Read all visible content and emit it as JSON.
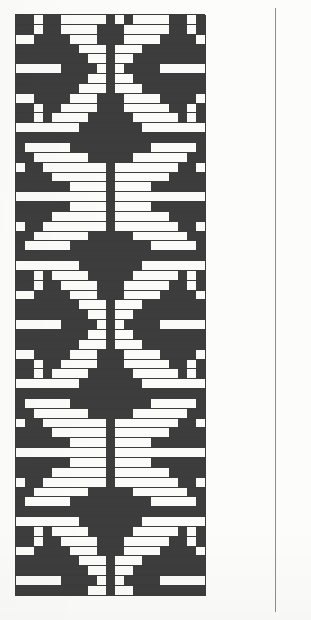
{
  "document": {
    "type": "knitting-chart",
    "corner_mark": "",
    "background_color": "#fcfcfb",
    "rule_color": "#8e8e8e"
  },
  "chart_data": {
    "type": "heatmap",
    "title": "",
    "subtitle": "",
    "xlabel": "",
    "ylabel": "",
    "columns": 21,
    "rows": 59,
    "legend": [
      {
        "key": 1,
        "label": "dark stitch",
        "color": "#3d3d3d"
      },
      {
        "key": 0,
        "label": "light stitch",
        "color": "#fbfbfa"
      }
    ],
    "grid": true,
    "grid_line_color": "#3b3b3b",
    "cell_width_px": 10,
    "cell_height_px": 9.85,
    "origin_px": {
      "x": 15,
      "y": 14
    },
    "values": [
      [
        1,
        1,
        0,
        1,
        1,
        0,
        0,
        0,
        0,
        0,
        1,
        0,
        1,
        0,
        0,
        0,
        0,
        1,
        1,
        0,
        1
      ],
      [
        1,
        1,
        0,
        1,
        1,
        0,
        0,
        0,
        0,
        1,
        1,
        1,
        0,
        0,
        0,
        0,
        0,
        1,
        1,
        0,
        1
      ],
      [
        0,
        0,
        1,
        1,
        1,
        1,
        0,
        0,
        0,
        1,
        1,
        1,
        0,
        0,
        0,
        0,
        1,
        1,
        1,
        1,
        0
      ],
      [
        1,
        1,
        1,
        1,
        1,
        1,
        1,
        0,
        0,
        0,
        1,
        0,
        0,
        0,
        1,
        1,
        1,
        1,
        1,
        1,
        1
      ],
      [
        1,
        1,
        1,
        1,
        1,
        1,
        1,
        1,
        0,
        0,
        1,
        0,
        0,
        1,
        1,
        1,
        1,
        1,
        1,
        1,
        1
      ],
      [
        0,
        0,
        0,
        0,
        0,
        1,
        1,
        1,
        1,
        0,
        1,
        0,
        1,
        1,
        1,
        1,
        0,
        0,
        0,
        0,
        0
      ],
      [
        1,
        1,
        1,
        1,
        1,
        1,
        1,
        1,
        0,
        0,
        1,
        0,
        0,
        1,
        1,
        1,
        1,
        1,
        1,
        1,
        1
      ],
      [
        1,
        1,
        1,
        1,
        1,
        1,
        1,
        0,
        0,
        0,
        1,
        0,
        0,
        0,
        1,
        1,
        1,
        1,
        1,
        1,
        1
      ],
      [
        0,
        0,
        1,
        1,
        1,
        1,
        0,
        0,
        0,
        1,
        1,
        1,
        0,
        0,
        0,
        0,
        1,
        1,
        1,
        1,
        0
      ],
      [
        1,
        1,
        0,
        1,
        1,
        0,
        0,
        0,
        0,
        1,
        1,
        1,
        0,
        0,
        0,
        0,
        0,
        1,
        1,
        0,
        1
      ],
      [
        1,
        1,
        0,
        1,
        0,
        0,
        0,
        0,
        1,
        1,
        1,
        1,
        1,
        0,
        0,
        0,
        0,
        0,
        1,
        0,
        1
      ],
      [
        0,
        0,
        0,
        0,
        0,
        0,
        0,
        1,
        1,
        1,
        1,
        1,
        1,
        1,
        0,
        0,
        0,
        0,
        0,
        0,
        0
      ],
      [
        1,
        1,
        1,
        1,
        1,
        1,
        1,
        1,
        1,
        1,
        1,
        1,
        1,
        1,
        1,
        1,
        1,
        1,
        1,
        1,
        1
      ],
      [
        1,
        0,
        0,
        0,
        0,
        0,
        1,
        1,
        1,
        1,
        1,
        1,
        1,
        1,
        1,
        0,
        0,
        0,
        0,
        0,
        1
      ],
      [
        1,
        1,
        0,
        0,
        0,
        0,
        0,
        0,
        1,
        1,
        1,
        1,
        1,
        0,
        0,
        0,
        0,
        0,
        0,
        1,
        1
      ],
      [
        0,
        1,
        1,
        0,
        0,
        0,
        0,
        0,
        0,
        0,
        1,
        0,
        0,
        0,
        0,
        0,
        0,
        0,
        1,
        1,
        0
      ],
      [
        1,
        1,
        1,
        1,
        0,
        0,
        0,
        0,
        0,
        0,
        1,
        0,
        0,
        0,
        0,
        0,
        0,
        1,
        1,
        1,
        1
      ],
      [
        1,
        1,
        1,
        1,
        1,
        1,
        0,
        0,
        0,
        0,
        1,
        0,
        0,
        0,
        0,
        1,
        1,
        1,
        1,
        1,
        1
      ],
      [
        0,
        0,
        0,
        0,
        0,
        0,
        0,
        0,
        0,
        0,
        1,
        0,
        0,
        0,
        0,
        0,
        0,
        0,
        0,
        0,
        0
      ],
      [
        1,
        1,
        1,
        1,
        1,
        1,
        0,
        0,
        0,
        0,
        1,
        0,
        0,
        0,
        0,
        1,
        1,
        1,
        1,
        1,
        1
      ],
      [
        1,
        1,
        1,
        1,
        0,
        0,
        0,
        0,
        0,
        0,
        1,
        0,
        0,
        0,
        0,
        0,
        0,
        1,
        1,
        1,
        1
      ],
      [
        0,
        1,
        1,
        0,
        0,
        0,
        0,
        0,
        0,
        0,
        1,
        0,
        0,
        0,
        0,
        0,
        0,
        0,
        1,
        1,
        0
      ],
      [
        1,
        1,
        0,
        0,
        0,
        0,
        0,
        0,
        1,
        1,
        1,
        1,
        1,
        0,
        0,
        0,
        0,
        0,
        0,
        1,
        1
      ],
      [
        1,
        0,
        0,
        0,
        0,
        0,
        1,
        1,
        1,
        1,
        1,
        1,
        1,
        1,
        1,
        0,
        0,
        0,
        0,
        0,
        1
      ],
      [
        1,
        1,
        1,
        1,
        1,
        1,
        1,
        1,
        1,
        1,
        1,
        1,
        1,
        1,
        1,
        1,
        1,
        1,
        1,
        1,
        1
      ],
      [
        0,
        0,
        0,
        0,
        0,
        0,
        0,
        1,
        1,
        1,
        1,
        1,
        1,
        1,
        0,
        0,
        0,
        0,
        0,
        0,
        0
      ],
      [
        1,
        1,
        0,
        1,
        0,
        0,
        0,
        0,
        1,
        1,
        1,
        1,
        1,
        0,
        0,
        0,
        0,
        0,
        1,
        0,
        1
      ],
      [
        1,
        1,
        0,
        1,
        1,
        0,
        0,
        0,
        0,
        1,
        1,
        1,
        0,
        0,
        0,
        0,
        0,
        1,
        1,
        0,
        1
      ],
      [
        0,
        0,
        1,
        1,
        1,
        1,
        0,
        0,
        0,
        1,
        1,
        1,
        0,
        0,
        0,
        0,
        1,
        1,
        1,
        1,
        0
      ],
      [
        1,
        1,
        1,
        1,
        1,
        1,
        1,
        0,
        0,
        0,
        1,
        0,
        0,
        0,
        1,
        1,
        1,
        1,
        1,
        1,
        1
      ],
      [
        1,
        1,
        1,
        1,
        1,
        1,
        1,
        1,
        0,
        0,
        1,
        0,
        0,
        1,
        1,
        1,
        1,
        1,
        1,
        1,
        1
      ],
      [
        0,
        0,
        0,
        0,
        0,
        1,
        1,
        1,
        1,
        0,
        1,
        0,
        1,
        1,
        1,
        1,
        0,
        0,
        0,
        0,
        0
      ],
      [
        1,
        1,
        1,
        1,
        1,
        1,
        1,
        1,
        0,
        0,
        1,
        0,
        0,
        1,
        1,
        1,
        1,
        1,
        1,
        1,
        1
      ],
      [
        1,
        1,
        1,
        1,
        1,
        1,
        1,
        0,
        0,
        0,
        1,
        0,
        0,
        0,
        1,
        1,
        1,
        1,
        1,
        1,
        1
      ],
      [
        0,
        0,
        1,
        1,
        1,
        1,
        0,
        0,
        0,
        1,
        1,
        1,
        0,
        0,
        0,
        0,
        1,
        1,
        1,
        1,
        0
      ],
      [
        1,
        1,
        0,
        1,
        1,
        0,
        0,
        0,
        0,
        1,
        1,
        1,
        0,
        0,
        0,
        0,
        0,
        1,
        1,
        0,
        1
      ],
      [
        1,
        1,
        0,
        1,
        0,
        0,
        0,
        0,
        1,
        1,
        1,
        1,
        1,
        0,
        0,
        0,
        0,
        0,
        1,
        0,
        1
      ],
      [
        0,
        0,
        0,
        0,
        0,
        0,
        0,
        1,
        1,
        1,
        1,
        1,
        1,
        1,
        0,
        0,
        0,
        0,
        0,
        0,
        0
      ],
      [
        1,
        1,
        1,
        1,
        1,
        1,
        1,
        1,
        1,
        1,
        1,
        1,
        1,
        1,
        1,
        1,
        1,
        1,
        1,
        1,
        1
      ],
      [
        1,
        0,
        0,
        0,
        0,
        0,
        1,
        1,
        1,
        1,
        1,
        1,
        1,
        1,
        1,
        0,
        0,
        0,
        0,
        0,
        1
      ],
      [
        1,
        1,
        0,
        0,
        0,
        0,
        0,
        0,
        1,
        1,
        1,
        1,
        1,
        0,
        0,
        0,
        0,
        0,
        0,
        1,
        1
      ],
      [
        0,
        1,
        1,
        0,
        0,
        0,
        0,
        0,
        0,
        0,
        1,
        0,
        0,
        0,
        0,
        0,
        0,
        0,
        1,
        1,
        0
      ],
      [
        1,
        1,
        1,
        1,
        0,
        0,
        0,
        0,
        0,
        0,
        1,
        0,
        0,
        0,
        0,
        0,
        0,
        1,
        1,
        1,
        1
      ],
      [
        1,
        1,
        1,
        1,
        1,
        1,
        0,
        0,
        0,
        0,
        1,
        0,
        0,
        0,
        0,
        1,
        1,
        1,
        1,
        1,
        1
      ],
      [
        0,
        0,
        0,
        0,
        0,
        0,
        0,
        0,
        0,
        0,
        1,
        0,
        0,
        0,
        0,
        0,
        0,
        0,
        0,
        0,
        0
      ],
      [
        1,
        1,
        1,
        1,
        1,
        1,
        0,
        0,
        0,
        0,
        1,
        0,
        0,
        0,
        0,
        1,
        1,
        1,
        1,
        1,
        1
      ],
      [
        1,
        1,
        1,
        1,
        0,
        0,
        0,
        0,
        0,
        0,
        1,
        0,
        0,
        0,
        0,
        0,
        0,
        1,
        1,
        1,
        1
      ],
      [
        0,
        1,
        1,
        0,
        0,
        0,
        0,
        0,
        0,
        0,
        1,
        0,
        0,
        0,
        0,
        0,
        0,
        0,
        1,
        1,
        0
      ],
      [
        1,
        1,
        0,
        0,
        0,
        0,
        0,
        0,
        1,
        1,
        1,
        1,
        1,
        0,
        0,
        0,
        0,
        0,
        0,
        1,
        1
      ],
      [
        1,
        0,
        0,
        0,
        0,
        0,
        1,
        1,
        1,
        1,
        1,
        1,
        1,
        1,
        1,
        0,
        0,
        0,
        0,
        0,
        1
      ],
      [
        1,
        1,
        1,
        1,
        1,
        1,
        1,
        1,
        1,
        1,
        1,
        1,
        1,
        1,
        1,
        1,
        1,
        1,
        1,
        1,
        1
      ],
      [
        0,
        0,
        0,
        0,
        0,
        0,
        0,
        1,
        1,
        1,
        1,
        1,
        1,
        1,
        0,
        0,
        0,
        0,
        0,
        0,
        0
      ],
      [
        1,
        1,
        0,
        1,
        0,
        0,
        0,
        0,
        1,
        1,
        1,
        1,
        1,
        0,
        0,
        0,
        0,
        0,
        1,
        0,
        1
      ],
      [
        1,
        1,
        0,
        1,
        1,
        0,
        0,
        0,
        0,
        1,
        1,
        1,
        0,
        0,
        0,
        0,
        0,
        1,
        1,
        0,
        1
      ],
      [
        0,
        0,
        1,
        1,
        1,
        1,
        0,
        0,
        0,
        1,
        1,
        1,
        0,
        0,
        0,
        0,
        1,
        1,
        1,
        1,
        0
      ],
      [
        1,
        1,
        1,
        1,
        1,
        1,
        1,
        0,
        0,
        0,
        1,
        0,
        0,
        0,
        1,
        1,
        1,
        1,
        1,
        1,
        1
      ],
      [
        1,
        1,
        1,
        1,
        1,
        1,
        1,
        1,
        0,
        0,
        1,
        0,
        0,
        1,
        1,
        1,
        1,
        1,
        1,
        1,
        1
      ],
      [
        0,
        0,
        0,
        0,
        0,
        1,
        1,
        1,
        1,
        0,
        1,
        0,
        1,
        1,
        1,
        1,
        0,
        0,
        0,
        0,
        0
      ],
      [
        1,
        1,
        1,
        1,
        1,
        1,
        1,
        1,
        0,
        0,
        1,
        0,
        0,
        1,
        1,
        1,
        1,
        1,
        1,
        1,
        1
      ]
    ]
  }
}
